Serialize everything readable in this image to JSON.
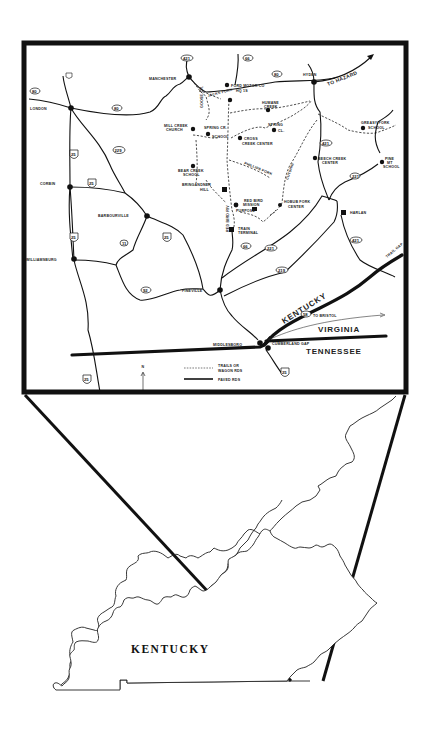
{
  "figure": {
    "type": "locator map",
    "inset_region": "Southeastern Kentucky (Clay, Leslie, Bell, Knox, Whitley, Harlan counties area)",
    "state_label": "KENTUCKY"
  },
  "towns": [
    {
      "name": "MANCHESTER"
    },
    {
      "name": "LONDON"
    },
    {
      "name": "HYDEN"
    },
    {
      "name": "CORBIN"
    },
    {
      "name": "BARBOURVILLE"
    },
    {
      "name": "WILLIAMSBURG"
    },
    {
      "name": "PINEVILLE"
    },
    {
      "name": "MIDDLESBORO"
    },
    {
      "name": "HARLAN"
    },
    {
      "name": "CUMBERLAND GAP"
    }
  ],
  "sites": [
    {
      "name": "FORD MOTOR CO",
      "sub": "HQ 1S"
    },
    {
      "name": "MILL CREEK",
      "sub": "CHURCH"
    },
    {
      "name": "SPRING CR.",
      "sub": "SCHOOL"
    },
    {
      "name": "HUMANE",
      "sub": "CREEK"
    },
    {
      "name": "SPRING",
      "sub": "CL."
    },
    {
      "name": "CROSS",
      "sub": "CREEK CENTER"
    },
    {
      "name": "BEAR CREEK",
      "sub": "SCHOOL"
    },
    {
      "name": "BRINGANDNER",
      "sub": "HILL"
    },
    {
      "name": "RED BIRD",
      "sub": "MISSION"
    },
    {
      "name": "PURPOSE"
    },
    {
      "name": "TRAIN",
      "sub": "TERMINAL"
    },
    {
      "name": "HOBUB FORK",
      "sub": "CENTER"
    },
    {
      "name": "GREASY FORK",
      "sub": "SCHOOL"
    },
    {
      "name": "BEECH CREEK",
      "sub": "CENTER"
    },
    {
      "name": "PINE",
      "sub": "MT",
      "sub2": "SCHOOL"
    },
    {
      "name": "TRAIL GAP"
    }
  ],
  "route_markers": {
    "ovals": [
      "421",
      "80",
      "80",
      "66",
      "80",
      "229",
      "11",
      "92",
      "66",
      "421",
      "221",
      "219",
      "58",
      "421",
      "25"
    ],
    "shields": [
      "25 E",
      "25 W",
      "25 W",
      "25 E",
      "25"
    ]
  },
  "road_labels": {
    "to_hazard": "TO HAZARD",
    "to_bristol": "TO BRISTOL",
    "red_bird_river": "RED BIRD RIV",
    "phillips_fork": "PHILLIPS FORK",
    "goose_cr": "GOOSE CR.",
    "jacks_fork": "JACKS FORK",
    "cutshin": "CUTSHIN"
  },
  "state_labels": {
    "kentucky": "KENTUCKY",
    "virginia": "VIRGINIA",
    "tennessee": "TENNESSEE"
  },
  "legend": {
    "trails_label_1": "TRAILS OR",
    "trails_label_2": "WAGON RDS",
    "paved_label": "PAVED RDS",
    "north": "N"
  },
  "colors": {
    "ink": "#111111",
    "paper": "#ffffff"
  }
}
